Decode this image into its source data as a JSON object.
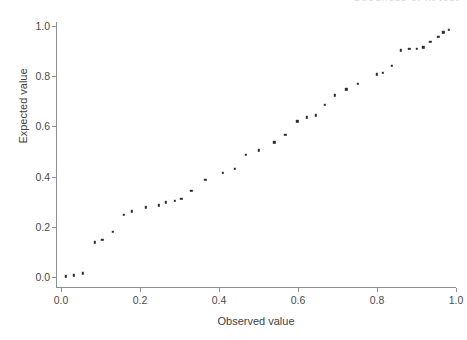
{
  "figure": {
    "top_caption": "Goodness of fit test",
    "background_color": "#ffffff",
    "point_color": "#2b2b2b",
    "axis_color": "#8d8d96"
  },
  "chart_data": {
    "type": "scatter",
    "title": "",
    "xlabel": "Observed value",
    "ylabel": "Expected value",
    "xlim": [
      0.0,
      1.0
    ],
    "ylim": [
      0.0,
      1.0
    ],
    "grid": false,
    "legend": null,
    "xticks": [
      0.0,
      0.2,
      0.4,
      0.6,
      0.8,
      1.0
    ],
    "yticks": [
      0.0,
      0.2,
      0.4,
      0.6,
      0.8,
      1.0
    ],
    "xticklabels": [
      "0.0",
      "0.2",
      "0.4",
      "0.6",
      "0.8",
      "1.0"
    ],
    "yticklabels": [
      "0.0",
      "0.2",
      "0.4",
      "0.6",
      "0.8",
      "1.0"
    ],
    "marker": "square",
    "marker_size": 2.4,
    "series": [
      {
        "name": "Expected vs Observed",
        "x": [
          0.012,
          0.033,
          0.055,
          0.086,
          0.105,
          0.131,
          0.159,
          0.18,
          0.214,
          0.247,
          0.265,
          0.288,
          0.305,
          0.33,
          0.365,
          0.409,
          0.44,
          0.468,
          0.5,
          0.54,
          0.568,
          0.598,
          0.623,
          0.645,
          0.668,
          0.693,
          0.722,
          0.752,
          0.8,
          0.815,
          0.838,
          0.86,
          0.882,
          0.9,
          0.917,
          0.935,
          0.955,
          0.968,
          0.982
        ],
        "y": [
          0.002,
          0.006,
          0.015,
          0.138,
          0.147,
          0.181,
          0.249,
          0.261,
          0.277,
          0.286,
          0.298,
          0.304,
          0.311,
          0.343,
          0.387,
          0.414,
          0.432,
          0.486,
          0.505,
          0.537,
          0.567,
          0.621,
          0.637,
          0.644,
          0.686,
          0.724,
          0.748,
          0.77,
          0.808,
          0.813,
          0.841,
          0.903,
          0.908,
          0.91,
          0.915,
          0.938,
          0.958,
          0.975,
          0.984
        ]
      }
    ]
  }
}
